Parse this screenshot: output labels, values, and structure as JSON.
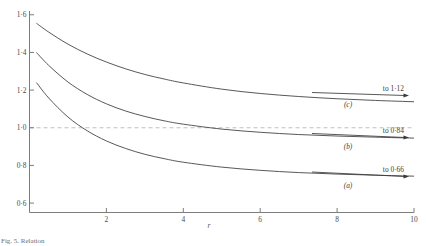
{
  "figure": {
    "caption": "Fig. 5. Relation",
    "reference_line_value": "1.0"
  },
  "chart_data": {
    "type": "line",
    "title": "",
    "xlabel": "r",
    "ylabel": "",
    "xlim": [
      0,
      10
    ],
    "ylim": [
      0.55,
      1.62
    ],
    "grid": false,
    "legend": "inline-right",
    "x_ticks": [
      2,
      4,
      6,
      8,
      10
    ],
    "x_tick_labels": [
      "2",
      "4",
      "6",
      "8",
      "10"
    ],
    "y_ticks": [
      0.6,
      0.8,
      1.0,
      1.2,
      1.4,
      1.6
    ],
    "y_tick_labels": [
      "0·6",
      "0·8",
      "1·0",
      "1·2",
      "1·4",
      "1·6"
    ],
    "reference_lines": [
      {
        "orientation": "horizontal",
        "value": 1.0,
        "style": "dashed",
        "color": "#b9b9b9"
      }
    ],
    "series": [
      {
        "name": "(c)",
        "label": "(c)",
        "asymptote_text": "to 1·12",
        "asymptote_value": 1.12,
        "x": [
          0.18,
          0.5,
          1.0,
          1.5,
          2.0,
          2.5,
          3.0,
          3.5,
          4.0,
          5.0,
          6.0,
          7.0,
          8.0,
          9.0,
          10.0
        ],
        "values": [
          1.555,
          1.508,
          1.444,
          1.392,
          1.349,
          1.313,
          1.283,
          1.259,
          1.238,
          1.205,
          1.182,
          1.166,
          1.154,
          1.145,
          1.138
        ]
      },
      {
        "name": "(b)",
        "label": "(b)",
        "asymptote_text": "to 0·84",
        "asymptote_value": 0.84,
        "x": [
          0.18,
          0.5,
          1.0,
          1.5,
          2.0,
          2.5,
          3.0,
          3.5,
          4.0,
          5.0,
          6.0,
          7.0,
          8.0,
          9.0,
          10.0
        ],
        "values": [
          1.4,
          1.331,
          1.243,
          1.177,
          1.127,
          1.089,
          1.06,
          1.037,
          1.019,
          0.993,
          0.976,
          0.964,
          0.956,
          0.95,
          0.945
        ]
      },
      {
        "name": "(a)",
        "label": "(a)",
        "asymptote_text": "to 0·66",
        "asymptote_value": 0.66,
        "x": [
          0.18,
          0.5,
          1.0,
          1.5,
          2.0,
          2.5,
          3.0,
          3.5,
          4.0,
          5.0,
          6.0,
          7.0,
          8.0,
          9.0,
          10.0
        ],
        "values": [
          1.24,
          1.158,
          1.057,
          0.984,
          0.93,
          0.89,
          0.859,
          0.836,
          0.817,
          0.791,
          0.774,
          0.762,
          0.754,
          0.748,
          0.743
        ]
      }
    ],
    "annotations": [
      {
        "text": "to 1·12",
        "for": "(c)",
        "position": "right"
      },
      {
        "text": "to 0·84",
        "for": "(b)",
        "position": "right"
      },
      {
        "text": "to 0·66",
        "for": "(a)",
        "position": "right"
      }
    ]
  }
}
